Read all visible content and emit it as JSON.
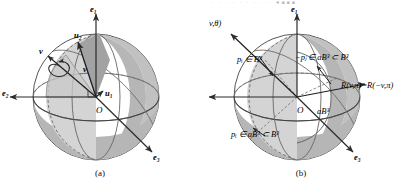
{
  "figure": {
    "top_fragment": "·  ·    ·  ·     ·  ·   · · ··◄■■■",
    "panels": [
      {
        "id": "a",
        "caption": "(a)",
        "labels": {
          "axis_e1": "e₁",
          "axis_e2": "e₂",
          "axis_e3": "e₃",
          "origin": "O",
          "vec_u1": "u₁",
          "vec_u2": "u₂",
          "vec_v": "v",
          "rotation_axis_v": "v"
        }
      },
      {
        "id": "b",
        "caption": "(b)",
        "labels": {
          "axis_e1": "e₁",
          "axis_e2": "e₂",
          "axis_e3": "e₃",
          "origin": "O",
          "rotation": "R(v,θ)",
          "point_pi_ball": "pᵢ ∈ B³",
          "point_neg_pj": "−pⱼ ∈ aB³ ⊂ B³",
          "point_pi_aball": "pᵢ ∈ aB³ ⊂ B³",
          "inner_ball": "aB³",
          "antipodal_identity": "R(v,π)=R(−v,π)"
        }
      }
    ],
    "colors": {
      "sphere_fill": "#ffffff",
      "shaded_band": "#b3b3b3",
      "light_wedge": "#d0d0d0",
      "mid_wedge": "#a8a8a8",
      "outline": "#4a4a4a",
      "text": "#111111"
    }
  }
}
